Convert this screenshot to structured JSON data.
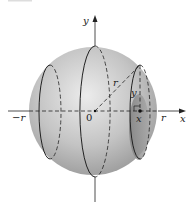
{
  "diagram": {
    "type": "sphere-cross-sections",
    "colors": {
      "sphere_light": "#e6e6e6",
      "sphere_mid": "#bdbdbd",
      "sphere_dark": "#9a9a9a",
      "slice_shade": "#8f8f8f",
      "stroke": "#222222",
      "top_bar": "#dddddd"
    },
    "labels": {
      "y_axis": "y",
      "x_axis": "x",
      "origin": "0",
      "neg_r": "−r",
      "pos_r": "r",
      "radius": "r",
      "height": "y",
      "x_pos": "x"
    }
  }
}
